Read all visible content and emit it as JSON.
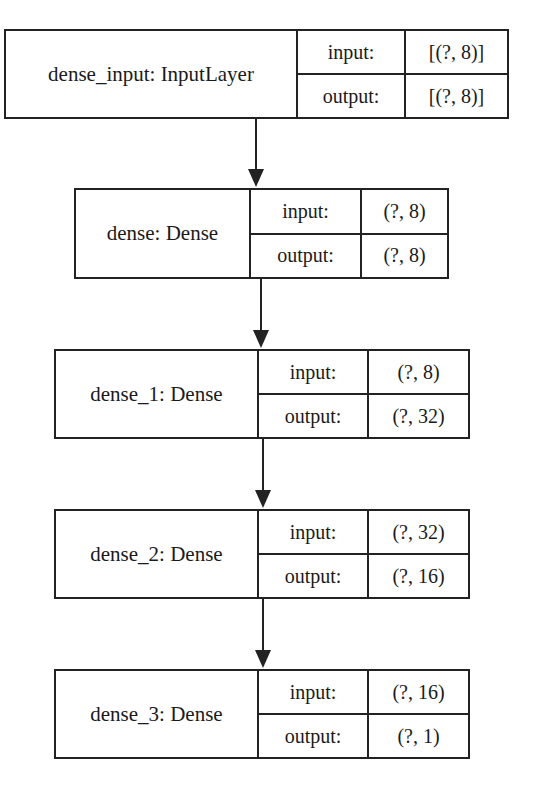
{
  "diagram": {
    "type": "keras-model-plot",
    "nodes": [
      {
        "id": "dense_input",
        "name": "dense_input: InputLayer",
        "input_label": "input:",
        "input_value": "[(?, 8)]",
        "output_label": "output:",
        "output_value": "[(?, 8)]"
      },
      {
        "id": "dense",
        "name": "dense: Dense",
        "input_label": "input:",
        "input_value": "(?, 8)",
        "output_label": "output:",
        "output_value": "(?, 8)"
      },
      {
        "id": "dense_1",
        "name": "dense_1: Dense",
        "input_label": "input:",
        "input_value": "(?, 8)",
        "output_label": "output:",
        "output_value": "(?, 32)"
      },
      {
        "id": "dense_2",
        "name": "dense_2: Dense",
        "input_label": "input:",
        "input_value": "(?, 32)",
        "output_label": "output:",
        "output_value": "(?, 16)"
      },
      {
        "id": "dense_3",
        "name": "dense_3: Dense",
        "input_label": "input:",
        "input_value": "(?, 16)",
        "output_label": "output:",
        "output_value": "(?, 1)"
      }
    ],
    "edges": [
      {
        "from": "dense_input",
        "to": "dense"
      },
      {
        "from": "dense",
        "to": "dense_1"
      },
      {
        "from": "dense_1",
        "to": "dense_2"
      },
      {
        "from": "dense_2",
        "to": "dense_3"
      }
    ]
  }
}
